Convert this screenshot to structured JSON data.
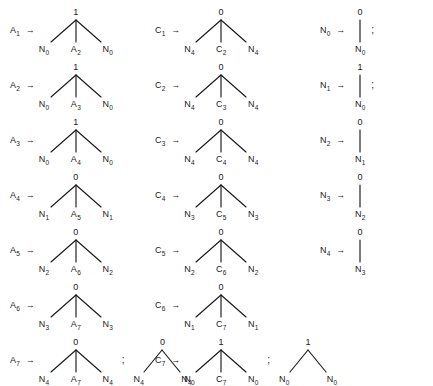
{
  "document": {
    "kind": "grammar-production-rules",
    "arrow_glyph": "→",
    "separator_glyph": ";",
    "ink_color": "#1a1a1a",
    "background_color": "#ffffff"
  },
  "columns": [
    {
      "name": "column-a",
      "rules": [
        {
          "lhs": "A",
          "lhs_sub": "1",
          "alternatives": [
            {
              "root": "1",
              "leaves": [
                {
                  "label": "N",
                  "sub": "0"
                },
                {
                  "label": "A",
                  "sub": "2"
                },
                {
                  "label": "N",
                  "sub": "0"
                }
              ]
            }
          ],
          "trailing_separator": ""
        },
        {
          "lhs": "A",
          "lhs_sub": "2",
          "alternatives": [
            {
              "root": "1",
              "leaves": [
                {
                  "label": "N",
                  "sub": "0"
                },
                {
                  "label": "A",
                  "sub": "3"
                },
                {
                  "label": "N",
                  "sub": "0"
                }
              ]
            }
          ],
          "trailing_separator": ""
        },
        {
          "lhs": "A",
          "lhs_sub": "3",
          "alternatives": [
            {
              "root": "1",
              "leaves": [
                {
                  "label": "N",
                  "sub": "0"
                },
                {
                  "label": "A",
                  "sub": "4"
                },
                {
                  "label": "N",
                  "sub": "0"
                }
              ]
            }
          ],
          "trailing_separator": ""
        },
        {
          "lhs": "A",
          "lhs_sub": "4",
          "alternatives": [
            {
              "root": "0",
              "leaves": [
                {
                  "label": "N",
                  "sub": "1"
                },
                {
                  "label": "A",
                  "sub": "5"
                },
                {
                  "label": "N",
                  "sub": "1"
                }
              ]
            }
          ],
          "trailing_separator": ""
        },
        {
          "lhs": "A",
          "lhs_sub": "5",
          "alternatives": [
            {
              "root": "0",
              "leaves": [
                {
                  "label": "N",
                  "sub": "2"
                },
                {
                  "label": "A",
                  "sub": "6"
                },
                {
                  "label": "N",
                  "sub": "2"
                }
              ]
            }
          ],
          "trailing_separator": ""
        },
        {
          "lhs": "A",
          "lhs_sub": "6",
          "alternatives": [
            {
              "root": "0",
              "leaves": [
                {
                  "label": "N",
                  "sub": "3"
                },
                {
                  "label": "A",
                  "sub": "7"
                },
                {
                  "label": "N",
                  "sub": "3"
                }
              ]
            }
          ],
          "trailing_separator": ""
        },
        {
          "lhs": "A",
          "lhs_sub": "7",
          "alternatives": [
            {
              "root": "0",
              "leaves": [
                {
                  "label": "N",
                  "sub": "4"
                },
                {
                  "label": "A",
                  "sub": "7"
                },
                {
                  "label": "N",
                  "sub": "4"
                }
              ]
            },
            {
              "root": "0",
              "leaves": [
                {
                  "label": "N",
                  "sub": "4"
                },
                {
                  "label": "N",
                  "sub": "4"
                }
              ]
            }
          ],
          "trailing_separator": ""
        }
      ]
    },
    {
      "name": "column-c",
      "rules": [
        {
          "lhs": "C",
          "lhs_sub": "1",
          "alternatives": [
            {
              "root": "0",
              "leaves": [
                {
                  "label": "N",
                  "sub": "4"
                },
                {
                  "label": "C",
                  "sub": "2"
                },
                {
                  "label": "N",
                  "sub": "4"
                }
              ]
            }
          ],
          "trailing_separator": ""
        },
        {
          "lhs": "C",
          "lhs_sub": "2",
          "alternatives": [
            {
              "root": "0",
              "leaves": [
                {
                  "label": "N",
                  "sub": "4"
                },
                {
                  "label": "C",
                  "sub": "3"
                },
                {
                  "label": "N",
                  "sub": "4"
                }
              ]
            }
          ],
          "trailing_separator": ""
        },
        {
          "lhs": "C",
          "lhs_sub": "3",
          "alternatives": [
            {
              "root": "0",
              "leaves": [
                {
                  "label": "N",
                  "sub": "4"
                },
                {
                  "label": "C",
                  "sub": "4"
                },
                {
                  "label": "N",
                  "sub": "4"
                }
              ]
            }
          ],
          "trailing_separator": ""
        },
        {
          "lhs": "C",
          "lhs_sub": "4",
          "alternatives": [
            {
              "root": "0",
              "leaves": [
                {
                  "label": "N",
                  "sub": "3"
                },
                {
                  "label": "C",
                  "sub": "5"
                },
                {
                  "label": "N",
                  "sub": "3"
                }
              ]
            }
          ],
          "trailing_separator": ""
        },
        {
          "lhs": "C",
          "lhs_sub": "5",
          "alternatives": [
            {
              "root": "0",
              "leaves": [
                {
                  "label": "N",
                  "sub": "2"
                },
                {
                  "label": "C",
                  "sub": "6"
                },
                {
                  "label": "N",
                  "sub": "2"
                }
              ]
            }
          ],
          "trailing_separator": ""
        },
        {
          "lhs": "C",
          "lhs_sub": "6",
          "alternatives": [
            {
              "root": "0",
              "leaves": [
                {
                  "label": "N",
                  "sub": "1"
                },
                {
                  "label": "C",
                  "sub": "7"
                },
                {
                  "label": "N",
                  "sub": "1"
                }
              ]
            }
          ],
          "trailing_separator": ""
        },
        {
          "lhs": "C",
          "lhs_sub": "7",
          "alternatives": [
            {
              "root": "1",
              "leaves": [
                {
                  "label": "N",
                  "sub": "0"
                },
                {
                  "label": "C",
                  "sub": "7"
                },
                {
                  "label": "N",
                  "sub": "0"
                }
              ]
            },
            {
              "root": "1",
              "leaves": [
                {
                  "label": "N",
                  "sub": "0"
                },
                {
                  "label": "N",
                  "sub": "0"
                }
              ]
            }
          ],
          "trailing_separator": ""
        }
      ]
    },
    {
      "name": "column-n",
      "rules": [
        {
          "lhs": "N",
          "lhs_sub": "0",
          "alternatives": [
            {
              "root": "0",
              "leaves": [
                {
                  "label": "N",
                  "sub": "0"
                }
              ]
            }
          ],
          "trailing_separator": ";"
        },
        {
          "lhs": "N",
          "lhs_sub": "1",
          "alternatives": [
            {
              "root": "1",
              "leaves": [
                {
                  "label": "N",
                  "sub": "0"
                }
              ]
            }
          ],
          "trailing_separator": ";"
        },
        {
          "lhs": "N",
          "lhs_sub": "2",
          "alternatives": [
            {
              "root": "0",
              "leaves": [
                {
                  "label": "N",
                  "sub": "1"
                }
              ]
            }
          ],
          "trailing_separator": ""
        },
        {
          "lhs": "N",
          "lhs_sub": "3",
          "alternatives": [
            {
              "root": "0",
              "leaves": [
                {
                  "label": "N",
                  "sub": "2"
                }
              ]
            }
          ],
          "trailing_separator": ""
        },
        {
          "lhs": "N",
          "lhs_sub": "4",
          "alternatives": [
            {
              "root": "0",
              "leaves": [
                {
                  "label": "N",
                  "sub": "3"
                }
              ]
            }
          ],
          "trailing_separator": ""
        }
      ]
    }
  ],
  "layout": {
    "column_x": [
      10,
      155,
      320
    ],
    "row_y": [
      8,
      63,
      118,
      173,
      228,
      283,
      338
    ],
    "n_column_row_y": [
      8,
      63,
      118,
      173,
      228
    ]
  }
}
